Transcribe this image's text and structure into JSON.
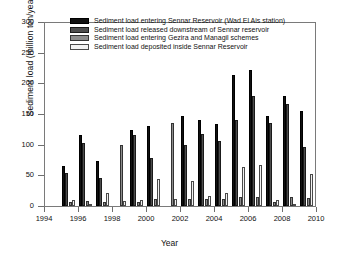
{
  "chart_data": {
    "type": "bar",
    "title": "",
    "xlabel": "Year",
    "ylabel": "Sediment load (million ton/year)",
    "ylim": [
      0,
      300
    ],
    "ytick_labels": [
      "0",
      "50",
      "100",
      "150",
      "200",
      "250",
      "300"
    ],
    "yticks": [
      0,
      50,
      100,
      150,
      200,
      250,
      300
    ],
    "xlim": [
      1994,
      2010
    ],
    "xtick_labels": [
      "1994",
      "1996",
      "1998",
      "2000",
      "2002",
      "2004",
      "2006",
      "2008",
      "2010"
    ],
    "xticks": [
      1994,
      1996,
      1998,
      2000,
      2002,
      2004,
      2006,
      2008,
      2010
    ],
    "grid": false,
    "legend_position": "top-center",
    "categories": [
      1995,
      1996,
      1997,
      1998,
      1999,
      2000,
      2001,
      2002,
      2003,
      2004,
      2005,
      2006,
      2007,
      2008,
      2009
    ],
    "series": [
      {
        "name": "Sediment load entering Sennar Reservoir (Wad El Ais station)",
        "color": "#111111",
        "values": [
          66,
          116,
          73,
          null,
          124,
          130,
          null,
          147,
          140,
          134,
          213,
          222,
          147,
          180,
          155
        ]
      },
      {
        "name": "Sediment load released downstream of Sennar reservoir",
        "color": "#4d4d4d",
        "values": [
          54,
          103,
          46,
          null,
          116,
          78,
          null,
          99,
          117,
          106,
          140,
          179,
          136,
          167,
          97
        ]
      },
      {
        "name": "Sediment load entering Gezira and Managil schemes",
        "color": "#8c8c8c",
        "values": [
          6,
          8,
          6,
          99,
          7,
          11,
          136,
          12,
          11,
          12,
          14,
          15,
          7,
          15,
          13
        ]
      },
      {
        "name": "Sediment load deposited inside Sennar Reservoir",
        "color": "#f2f2f2",
        "values": [
          9,
          4,
          22,
          8,
          9,
          44,
          11,
          41,
          17,
          21,
          64,
          67,
          9,
          4,
          53
        ]
      }
    ]
  }
}
